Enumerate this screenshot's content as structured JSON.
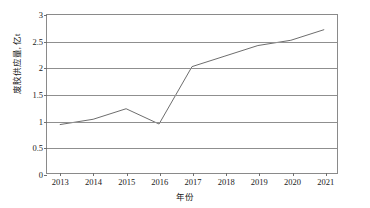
{
  "chart_data": {
    "type": "line",
    "title": "",
    "xlabel": "年份",
    "ylabel": "废胶供应量, 亿t",
    "categories": [
      "2013",
      "2014",
      "2015",
      "2016",
      "2017",
      "2018",
      "2019",
      "2020",
      "2021"
    ],
    "x": [
      2013,
      2014,
      2015,
      2016,
      2017,
      2018,
      2019,
      2020,
      2021
    ],
    "values": [
      0.92,
      1.02,
      1.22,
      0.93,
      2.02,
      2.22,
      2.42,
      2.52,
      2.72
    ],
    "series": [
      {
        "name": "废胶供应量",
        "values": [
          0.92,
          1.02,
          1.22,
          0.93,
          2.02,
          2.22,
          2.42,
          2.52,
          2.72
        ]
      }
    ],
    "ylim": [
      0,
      3
    ],
    "yticks": [
      0,
      0.5,
      1,
      1.5,
      2,
      2.5,
      3
    ],
    "ytick_labels": [
      "0",
      "0.5",
      "1",
      "1.5",
      "2",
      "2.5",
      "3"
    ],
    "xlim": [
      2012.6,
      2021.4
    ],
    "grid": "horizontal",
    "legend": "none",
    "line_color": "#6b6b6b",
    "axis_color": "#8a8a8a",
    "grid_color": "#8f8f8f",
    "background": "#ffffff",
    "markers": "none"
  }
}
